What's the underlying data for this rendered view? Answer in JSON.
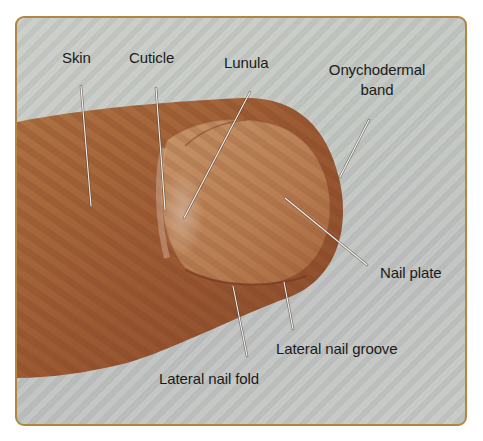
{
  "figure": {
    "type": "anatomical-photo",
    "frame_color": "#b3853e",
    "background_color": "#c3c6c1",
    "skin_color": "#a8683a",
    "nail_color": "#c08a5c",
    "leader_line_color": "#f2f2f2"
  },
  "labels": {
    "skin": "Skin",
    "cuticle": "Cuticle",
    "lunula": "Lunula",
    "onychodermal_line1": "Onychodermal",
    "onychodermal_line2": "band",
    "nail_plate": "Nail plate",
    "lateral_nail_groove": "Lateral nail groove",
    "lateral_nail_fold": "Lateral nail fold"
  }
}
